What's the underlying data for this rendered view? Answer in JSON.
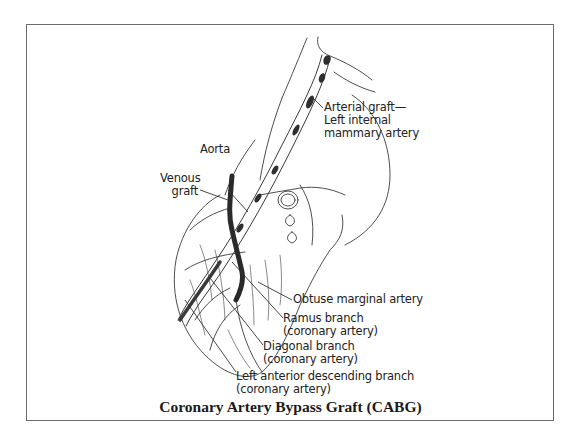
{
  "figure": {
    "title": "Coronary Artery Bypass Graft (CABG)",
    "labels": {
      "arterial_graft": [
        "Arterial graft—",
        "Left internal",
        "mammary artery"
      ],
      "aorta": "Aorta",
      "venous_graft": [
        "Venous",
        "graft"
      ],
      "obtuse_marginal": "Obtuse marginal artery",
      "ramus_branch": [
        "Ramus branch",
        "(coronary artery)"
      ],
      "diagonal_branch": [
        "Diagonal branch",
        "(coronary artery)"
      ],
      "lad_branch": [
        "Left anterior descending branch",
        "(coronary artery)"
      ]
    },
    "colors": {
      "line": "#3a3a3a",
      "graft": "#2a2a2a",
      "frame": "#6a6a6a"
    }
  }
}
